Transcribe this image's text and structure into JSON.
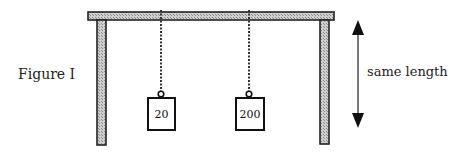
{
  "figure": {
    "label": "Figure I",
    "dimension_label": "same length",
    "weights": [
      {
        "label": "20"
      },
      {
        "label": "200"
      }
    ]
  }
}
